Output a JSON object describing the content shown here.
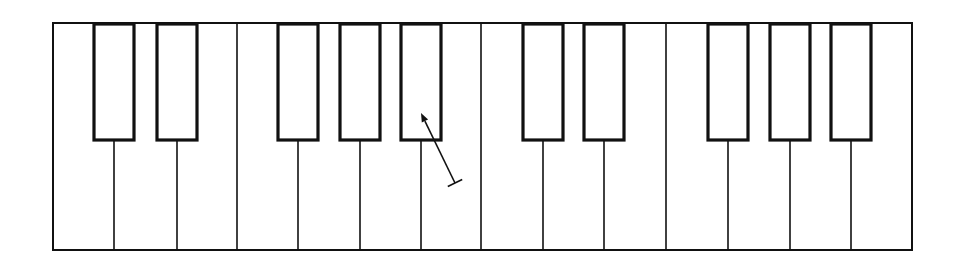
{
  "diagram": {
    "title": "",
    "type": "piano keyboard outline",
    "canvas": {
      "width": 958,
      "height": 264
    },
    "colors": {
      "stroke": "#111111",
      "background": "#ffffff",
      "black_key_fill": "#ffffff"
    },
    "outline": {
      "x1": 53,
      "y1": 23,
      "x2": 912,
      "y2": 250
    },
    "octave_dividers_x": [
      237,
      481,
      666
    ],
    "black_key_bottom_y": 140,
    "black_keys": [
      {
        "name": "C#",
        "x1": 94,
        "x2": 134
      },
      {
        "name": "D#",
        "x1": 157,
        "x2": 197
      },
      {
        "name": "F#",
        "x1": 278,
        "x2": 318
      },
      {
        "name": "G#",
        "x1": 340,
        "x2": 380
      },
      {
        "name": "A#",
        "x1": 401,
        "x2": 441
      },
      {
        "name": "C#",
        "x1": 523,
        "x2": 563
      },
      {
        "name": "D#",
        "x1": 584,
        "x2": 624
      },
      {
        "name": "F#",
        "x1": 708,
        "x2": 748
      },
      {
        "name": "G#",
        "x1": 770,
        "x2": 810
      },
      {
        "name": "A#",
        "x1": 831,
        "x2": 871
      }
    ],
    "white_key_count": 14,
    "pointer_arrow": {
      "icon": "arrow-pointer-icon",
      "head": {
        "x": 421,
        "y": 113
      },
      "tail": {
        "x": 455,
        "y": 183
      },
      "tail_bar_half_width": 8,
      "target": "A# key (first octave)"
    }
  }
}
